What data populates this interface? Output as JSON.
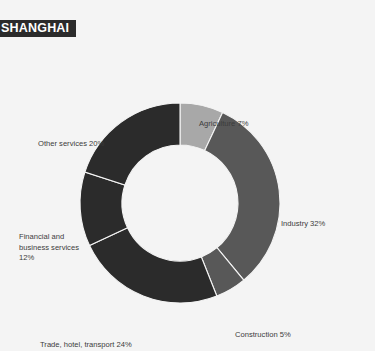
{
  "header": {
    "title": "SHANGHAI",
    "bar_color": "#2b2b2b",
    "text_color": "#ffffff"
  },
  "page": {
    "background_color": "#f4f4f4",
    "label_color": "#3c3c3c"
  },
  "chart_data": {
    "type": "pie",
    "variant": "donut",
    "title": "SHANGHAI",
    "xlabel": "",
    "ylabel": "",
    "units": "percent",
    "start_angle_oclock": 12,
    "direction": "clockwise",
    "inner_radius_ratio": 0.58,
    "separator_color": "#f4f4f4",
    "legend_position": "outside-labels",
    "grid": false,
    "categories": [
      "Agriculture",
      "Industry",
      "Construction",
      "Trade, hotel, transport",
      "Financial and business services",
      "Other services"
    ],
    "values": [
      7,
      32,
      5,
      24,
      12,
      20
    ],
    "colors": [
      "#a8a8a8",
      "#585858",
      "#585858",
      "#2b2b2b",
      "#2b2b2b",
      "#2b2b2b"
    ],
    "slices": [
      {
        "label": "Agriculture",
        "value": 7,
        "display": "Agriculture 7%",
        "color": "#a8a8a8"
      },
      {
        "label": "Industry",
        "value": 32,
        "display": "Industry 32%",
        "color": "#585858"
      },
      {
        "label": "Construction",
        "value": 5,
        "display": "Construction 5%",
        "color": "#585858"
      },
      {
        "label": "Trade, hotel, transport",
        "value": 24,
        "display": "Trade, hotel, transport 24%",
        "color": "#2b2b2b"
      },
      {
        "label": "Financial and business services",
        "value": 12,
        "display": "Financial and business services 12%",
        "color": "#2b2b2b"
      },
      {
        "label": "Other services",
        "value": 20,
        "display": "Other services 20%",
        "color": "#2b2b2b"
      }
    ]
  },
  "labels": {
    "agriculture": "Agriculture 7%",
    "industry": "Industry 32%",
    "construction": "Construction 5%",
    "trade": "Trade, hotel, transport 24%",
    "financial": "Financial and business services 12%",
    "other": "Other services 20%"
  }
}
